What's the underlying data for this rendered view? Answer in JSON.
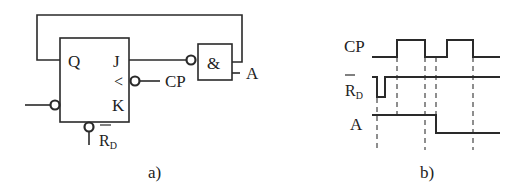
{
  "circuit": {
    "caption": "a)",
    "flipflop": {
      "pin_q": "Q",
      "pin_j": "J",
      "pin_clk": "<",
      "pin_k": "K"
    },
    "and_gate": {
      "symbol": "&"
    },
    "labels": {
      "clock": "CP",
      "input_a": "A",
      "reset_main": "R",
      "reset_sub": "D"
    }
  },
  "timing": {
    "caption": "b)",
    "signals": [
      {
        "name": "CP"
      },
      {
        "name": "R",
        "sub": "D",
        "overbar": true
      },
      {
        "name": "A"
      }
    ]
  },
  "colors": {
    "line": "#2a2a2a",
    "dashed": "#444444",
    "background": "#ffffff"
  }
}
